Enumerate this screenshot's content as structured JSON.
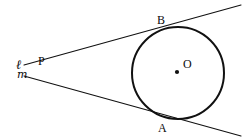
{
  "figure": {
    "kind": "geometry-diagram",
    "width": 242,
    "height": 140,
    "background_color": "#ffffff",
    "stroke_color": "#111111"
  },
  "circle": {
    "name": "circle-O",
    "center_label": "O",
    "center_x": 178,
    "center_y": 73,
    "radius": 46,
    "stroke_color": "#111111",
    "stroke_width": 2,
    "fill": "none"
  },
  "center_dot": {
    "name": "center-point-O",
    "x": 177,
    "y": 72,
    "radius": 2.1,
    "color": "#111111"
  },
  "points": [
    {
      "id": "P",
      "label": "P",
      "x": 38,
      "y": 70,
      "label_x": 38,
      "label_y": 55,
      "role": "external-point"
    },
    {
      "id": "B",
      "label": "B",
      "x": 158,
      "y": 30,
      "label_x": 157,
      "label_y": 14,
      "role": "tangent-point-upper"
    },
    {
      "id": "A",
      "label": "A",
      "x": 163,
      "y": 117,
      "label_x": 158,
      "label_y": 122,
      "role": "tangent-point-lower"
    },
    {
      "id": "O",
      "label": "O",
      "x": 177,
      "y": 72,
      "label_x": 183,
      "label_y": 58,
      "role": "circle-center"
    }
  ],
  "lines": [
    {
      "id": "ell",
      "label": "ℓ",
      "label_x": 16,
      "label_y": 58,
      "x1": 24,
      "y1": 65,
      "x2": 241,
      "y2": 5,
      "stroke_width": 1.1,
      "role": "upper-tangent-line"
    },
    {
      "id": "m",
      "label": "m",
      "label_x": 17,
      "label_y": 69,
      "x1": 24,
      "y1": 76,
      "x2": 241,
      "y2": 136,
      "stroke_width": 1.1,
      "role": "lower-tangent-line"
    }
  ]
}
